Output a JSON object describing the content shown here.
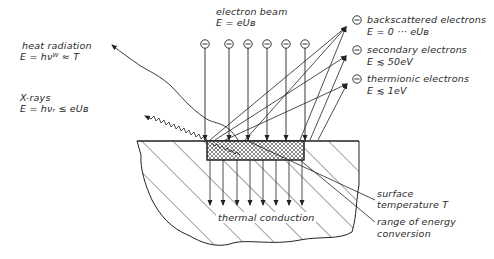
{
  "diagram": {
    "labels": {
      "electron_beam": {
        "name": "electron beam",
        "formula": "E = eUʙ"
      },
      "heat_radiation": {
        "name": "heat radiation",
        "formula": "E = hνᵂ ≈ T"
      },
      "x_rays": {
        "name": "X-rays",
        "formula": "E = hνᵣ ≤ eUʙ"
      },
      "backscattered": {
        "name": "backscattered electrons",
        "formula": "E = 0 ··· eUʙ"
      },
      "secondary": {
        "name": "secondary electrons",
        "formula": "E ≲ 50eV"
      },
      "thermionic": {
        "name": "thermionic electrons",
        "formula": "E ≲ 1eV"
      },
      "thermal_conduction": {
        "name": "thermal conduction"
      },
      "surface_temperature": {
        "name": "surface",
        "name2": "temperature T"
      },
      "range_energy": {
        "name": "range of energy",
        "name2": "conversion"
      }
    },
    "electron_symbol": "−",
    "incident_electron_count": 6,
    "colors": {
      "line": "#2a2a2a",
      "background": "#ffffff"
    }
  }
}
